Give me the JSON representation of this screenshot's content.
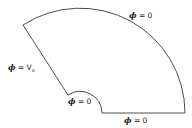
{
  "diagram": {
    "type": "annular-sector boundary value problem",
    "stroke_color": "#3a3a3a",
    "labels": {
      "outer_arc": {
        "symbol": "ϕ",
        "eq": " = 0"
      },
      "left_edge": {
        "symbol": "ϕ",
        "eq": " = V",
        "sub": "o"
      },
      "inner_arc": {
        "symbol": "ϕ",
        "eq": " = 0"
      },
      "bottom_edge": {
        "symbol": "ϕ",
        "eq": " = 0"
      }
    }
  }
}
